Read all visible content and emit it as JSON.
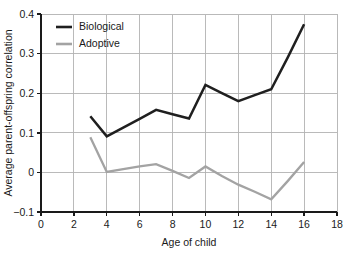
{
  "chart_data": {
    "type": "line",
    "title": "",
    "xlabel": "Age of child",
    "ylabel": "Average parent-offspring correlation",
    "xlim": [
      0,
      18
    ],
    "ylim": [
      -0.1,
      0.4
    ],
    "xticks": [
      0,
      2,
      4,
      6,
      8,
      10,
      12,
      14,
      16,
      18
    ],
    "xtick_labels": [
      "0",
      "2",
      "4",
      "6",
      "8",
      "10",
      "12",
      "14",
      "16",
      "18"
    ],
    "yticks": [
      -0.1,
      0,
      0.1,
      0.2,
      0.3,
      0.4
    ],
    "ytick_labels": [
      "−0.1",
      "0",
      "0.1",
      "0.2",
      "0.3",
      "0.4"
    ],
    "grid": true,
    "legend_position": "upper left",
    "series": [
      {
        "name": "Biological",
        "color": "#1f1f1f",
        "x": [
          3,
          4,
          5,
          6,
          7,
          8,
          9,
          10,
          11,
          12,
          13,
          14,
          15,
          16
        ],
        "values": [
          0.142,
          0.091,
          0.113,
          0.135,
          0.158,
          0.147,
          0.136,
          0.221,
          0.2,
          0.18,
          0.195,
          0.21,
          0.29,
          0.374
        ]
      },
      {
        "name": "Adoptive",
        "color": "#a3a3a3",
        "x": [
          3,
          4,
          5,
          6,
          7,
          8,
          9,
          10,
          11,
          12,
          13,
          14,
          15,
          16
        ],
        "values": [
          0.089,
          0.001,
          0.008,
          0.015,
          0.021,
          0.004,
          -0.014,
          0.015,
          -0.009,
          -0.031,
          -0.049,
          -0.068,
          -0.022,
          0.026
        ]
      }
    ]
  },
  "legend": {
    "items": [
      {
        "label": "Biological",
        "color": "#1f1f1f"
      },
      {
        "label": "Adoptive",
        "color": "#a3a3a3"
      }
    ]
  },
  "axes": {
    "x_title": "Age of child",
    "y_title": "Average parent-offspring correlation"
  }
}
